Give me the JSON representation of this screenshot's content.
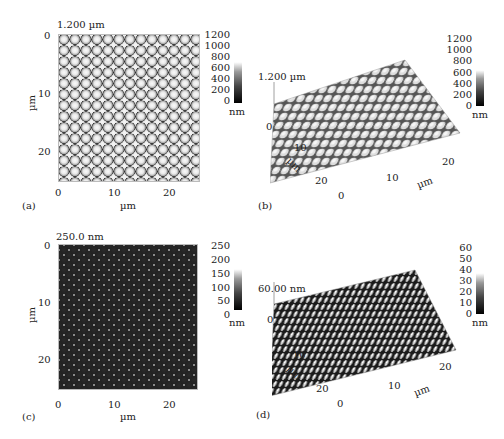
{
  "figure": {
    "panels": [
      {
        "id": "a",
        "label": "(a)",
        "type": "AFM 2D height image",
        "height_label": "1.200 µm",
        "x_ticks": [
          "0",
          "10",
          "20"
        ],
        "y_ticks": [
          "0",
          "10",
          "20"
        ],
        "xlabel": "µm",
        "ylabel": "µm",
        "colorbar_ticks": [
          "1200",
          "1000",
          "800",
          "600",
          "400",
          "200",
          "0"
        ],
        "colorbar_unit": "nm"
      },
      {
        "id": "b",
        "label": "(b)",
        "type": "AFM 3D height image",
        "height_label": "1.200 µm",
        "z_tick": "0",
        "x_ticks": [
          "0",
          "10",
          "20"
        ],
        "y_ticks": [
          "10",
          "20"
        ],
        "xlabel": "µm",
        "ylabel": "µm",
        "colorbar_ticks": [
          "1200",
          "1000",
          "800",
          "600",
          "400",
          "200",
          "0"
        ],
        "colorbar_unit": "nm"
      },
      {
        "id": "c",
        "label": "(c)",
        "type": "AFM 2D height image",
        "height_label": "250.0 nm",
        "x_ticks": [
          "0",
          "10",
          "20"
        ],
        "y_ticks": [
          "0",
          "10",
          "20"
        ],
        "xlabel": "µm",
        "ylabel": "µm",
        "colorbar_ticks": [
          "250",
          "200",
          "150",
          "100",
          "50",
          "0"
        ],
        "colorbar_unit": "nm"
      },
      {
        "id": "d",
        "label": "(d)",
        "type": "AFM 3D height image",
        "height_label": "60.00 nm",
        "z_tick": "0",
        "x_ticks": [
          "0",
          "10",
          "20"
        ],
        "y_ticks": [
          "10",
          "20"
        ],
        "xlabel": "µm",
        "ylabel": "µm",
        "colorbar_ticks": [
          "60",
          "50",
          "40",
          "30",
          "20",
          "10",
          "0"
        ],
        "colorbar_unit": "nm"
      }
    ]
  }
}
